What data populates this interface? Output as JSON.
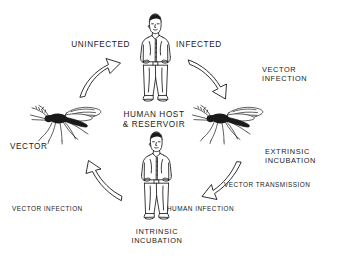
{
  "diagram": {
    "background_color": "#ffffff",
    "ink_color": "#1a1a1a",
    "labels": {
      "uninfected": "UNINFECTED",
      "infected": "INFECTED",
      "vector_infection_right": "VECTOR\nINFECTION",
      "human_host_reservoir": "HUMAN HOST\n& RESERVOIR",
      "vector": "VECTOR",
      "extrinsic_incubation": "EXTRINSIC\nINCUBATION",
      "vector_transmission": "VECTOR TRANSMISSION",
      "vector_infection_left": "VECTOR INFECTION",
      "human_infection": "HUMAN INFECTION",
      "intrinsic_incubation": "INTRINSIC\nINCUBATION"
    },
    "figures": {
      "human_top": "standing-human-figure",
      "human_bottom": "standing-human-figure",
      "mosquito_left": "mosquito-figure",
      "mosquito_right": "mosquito-figure"
    },
    "arrows": {
      "upper_left": "curved-arrow-up-right",
      "upper_right": "curved-arrow-down-right",
      "lower_right": "curved-arrow-down-left",
      "lower_left": "curved-arrow-up-left"
    }
  }
}
